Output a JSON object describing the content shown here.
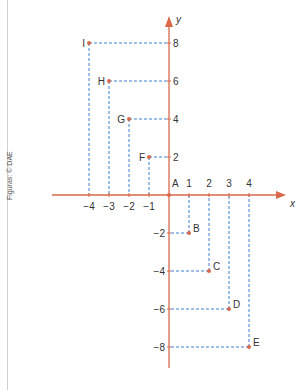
{
  "credit": "Figuras: © DAE",
  "colors": {
    "axis": "#d9694a",
    "guide": "#3a7fd1",
    "point": "#d9694a",
    "text": "#333333"
  },
  "chart_data": {
    "type": "scatter",
    "title": "",
    "xlabel": "x",
    "ylabel": "y",
    "origin_label": "A",
    "xlim": [
      -4.5,
      5
    ],
    "ylim": [
      -9,
      9
    ],
    "grid": false,
    "x_ticks": [
      -4,
      -3,
      -2,
      -1,
      1,
      2,
      3,
      4
    ],
    "y_ticks": [
      -8,
      -6,
      -4,
      -2,
      2,
      4,
      6,
      8
    ],
    "points": [
      {
        "label": "A",
        "x": 0,
        "y": 0
      },
      {
        "label": "B",
        "x": 1,
        "y": -2
      },
      {
        "label": "C",
        "x": 2,
        "y": -4
      },
      {
        "label": "D",
        "x": 3,
        "y": -6
      },
      {
        "label": "E",
        "x": 4,
        "y": -8
      },
      {
        "label": "F",
        "x": -1,
        "y": 2
      },
      {
        "label": "G",
        "x": -2,
        "y": 4
      },
      {
        "label": "H",
        "x": -3,
        "y": 6
      },
      {
        "label": "I",
        "x": -4,
        "y": 8
      }
    ],
    "guides": "dashed projection lines from each point to both axes"
  }
}
